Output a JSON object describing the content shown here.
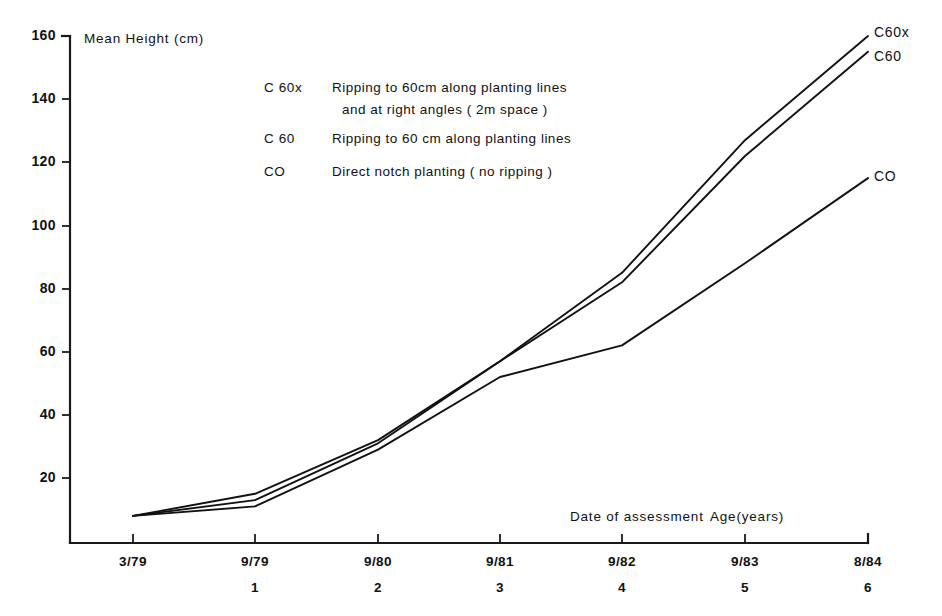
{
  "chart_data": {
    "type": "line",
    "title": "",
    "ylabel": "Mean Height (cm)",
    "xlabel": "Date of assessment   Age(years)",
    "xlabel_parts": {
      "date_of_assessment": "Date of assessment",
      "age_years": "Age(years)"
    },
    "categories": [
      "3/79",
      "9/79",
      "9/80",
      "9/81",
      "9/82",
      "9/83",
      "8/84"
    ],
    "age_labels": [
      "",
      "1",
      "2",
      "3",
      "4",
      "5",
      "6"
    ],
    "yticks": [
      20,
      40,
      60,
      80,
      100,
      120,
      140,
      160
    ],
    "ylim": [
      0,
      160
    ],
    "grid": false,
    "legend_position": "upper-left-inside",
    "series": [
      {
        "name": "C 60x",
        "end_label": "C60x",
        "values": [
          8,
          15,
          32,
          57,
          85,
          127,
          160
        ]
      },
      {
        "name": "C 60",
        "end_label": "C60",
        "values": [
          8,
          13,
          31,
          57,
          82,
          122,
          155
        ]
      },
      {
        "name": "CO",
        "end_label": "CO",
        "values": [
          8,
          11,
          29,
          52,
          62,
          88,
          115
        ]
      }
    ]
  },
  "legend": {
    "entries": [
      {
        "key": "C 60x",
        "description_line1": "Ripping to 60cm along planting lines",
        "description_line2": "and at right angles ( 2m space )"
      },
      {
        "key": "C 60",
        "description_line1": "Ripping to 60 cm along planting lines",
        "description_line2": ""
      },
      {
        "key": "CO",
        "description_line1": "Direct notch planting ( no ripping )",
        "description_line2": ""
      }
    ]
  },
  "axis": {
    "y_title": "Mean Height (cm)",
    "x_title_date": "Date of assessment",
    "x_title_age": "Age(years)"
  }
}
